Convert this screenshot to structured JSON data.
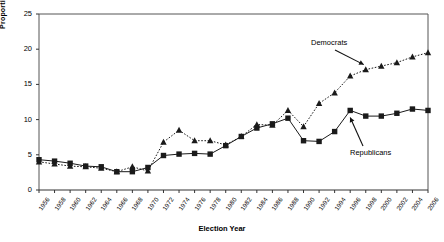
{
  "chart_data": {
    "type": "line",
    "title": "",
    "xlabel": "Election Year",
    "ylabel": "Proportion",
    "ylim": [
      0,
      25
    ],
    "yticks": [
      0,
      5,
      10,
      15,
      20,
      25
    ],
    "grid": false,
    "legend_position": "annotations-inline",
    "categories": [
      "1956",
      "1958",
      "1960",
      "1962",
      "1964",
      "1966",
      "1968",
      "1970",
      "1972",
      "1974",
      "1976",
      "1978",
      "1980",
      "1982",
      "1984",
      "1986",
      "1988",
      "1990",
      "1992",
      "1994",
      "1996",
      "1998",
      "2000",
      "2002",
      "2004",
      "2006"
    ],
    "series": [
      {
        "name": "Democrats",
        "marker": "triangle",
        "line_style": "dotted",
        "color": "#1a1a1a",
        "values": [
          4.0,
          3.7,
          3.4,
          3.3,
          3.1,
          2.6,
          3.3,
          2.7,
          6.8,
          8.5,
          7.0,
          7.0,
          6.4,
          7.6,
          9.3,
          9.2,
          11.3,
          9.0,
          12.3,
          13.8,
          16.2,
          17.1,
          17.6,
          18.1,
          18.9,
          19.5
        ]
      },
      {
        "name": "Republicans",
        "marker": "square",
        "line_style": "solid",
        "color": "#1a1a1a",
        "values": [
          4.3,
          4.1,
          3.8,
          3.4,
          3.3,
          2.6,
          2.6,
          3.2,
          4.9,
          5.1,
          5.2,
          5.1,
          6.3,
          7.6,
          8.8,
          9.4,
          10.2,
          7.0,
          6.9,
          8.3,
          11.3,
          10.5,
          10.5,
          10.9,
          11.5,
          11.3
        ]
      }
    ],
    "annotations": [
      {
        "text": "Democrats",
        "points_to": "Democrats"
      },
      {
        "text": "Republicans",
        "points_to": "Republicans"
      }
    ]
  }
}
